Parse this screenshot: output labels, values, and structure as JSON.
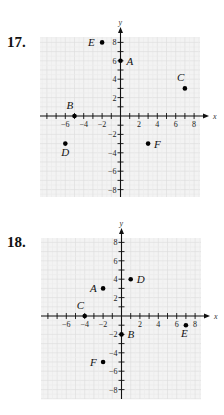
{
  "colors": {
    "grid_bg": "#f3f3f3",
    "grid_line": "#dcdcdc",
    "grid_half": "#ebebeb",
    "axis": "#111111",
    "point": "#000000"
  },
  "chart_data": [
    {
      "type": "scatter",
      "title": "17.",
      "xlabel": "x",
      "ylabel": "y",
      "xlim": [
        -8,
        8
      ],
      "ylim": [
        -8,
        8
      ],
      "grid": true,
      "x_ticks": [
        -6,
        -4,
        -2,
        2,
        4,
        6,
        8
      ],
      "y_ticks": [
        8,
        6,
        4,
        2,
        -2,
        -4,
        -6,
        -8
      ],
      "points": [
        {
          "label": "A",
          "x": 0,
          "y": 6
        },
        {
          "label": "B",
          "x": -5,
          "y": 0
        },
        {
          "label": "C",
          "x": 7,
          "y": 3
        },
        {
          "label": "D",
          "x": -6,
          "y": -3
        },
        {
          "label": "E",
          "x": -2,
          "y": 8
        },
        {
          "label": "F",
          "x": 3,
          "y": -3
        }
      ]
    },
    {
      "type": "scatter",
      "title": "18.",
      "xlabel": "x",
      "ylabel": "y",
      "xlim": [
        -8,
        8
      ],
      "ylim": [
        -8,
        8
      ],
      "grid": true,
      "x_ticks": [
        -6,
        -4,
        -2,
        2,
        4,
        6,
        8
      ],
      "y_ticks": [
        8,
        6,
        4,
        2,
        -2,
        -4,
        -6,
        -8
      ],
      "points": [
        {
          "label": "A",
          "x": -2,
          "y": 3
        },
        {
          "label": "B",
          "x": 0,
          "y": -2
        },
        {
          "label": "C",
          "x": -4,
          "y": 0
        },
        {
          "label": "D",
          "x": 1,
          "y": 4
        },
        {
          "label": "E",
          "x": 7,
          "y": -1
        },
        {
          "label": "F",
          "x": -2,
          "y": -5
        }
      ]
    }
  ],
  "problems": [
    {
      "number": "17."
    },
    {
      "number": "18."
    }
  ]
}
